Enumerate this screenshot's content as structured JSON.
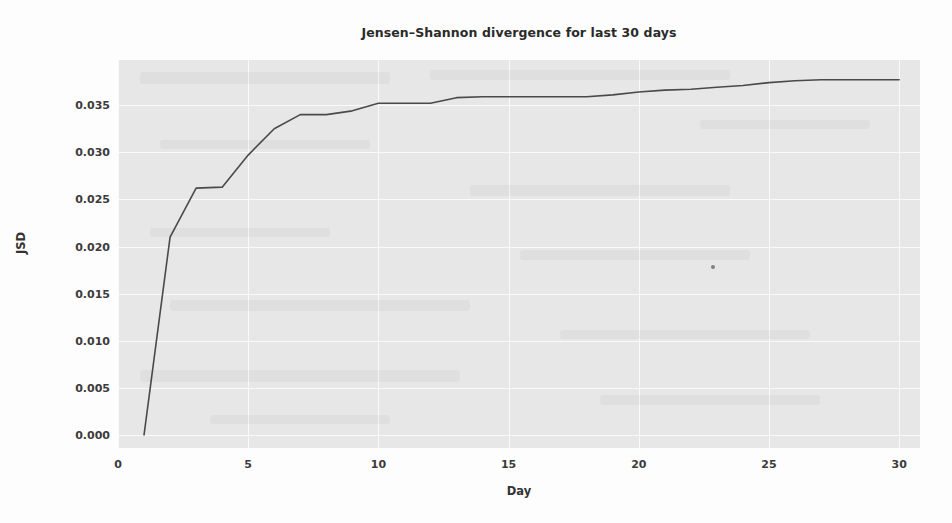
{
  "chart_data": {
    "type": "line",
    "title": "Jensen–Shannon divergence for last 30 days",
    "xlabel": "Day",
    "ylabel": "JSD",
    "xlim": [
      0,
      30.8
    ],
    "ylim": [
      -0.0014,
      0.0398
    ],
    "grid": true,
    "legend": null,
    "xticks": [
      0,
      5,
      10,
      15,
      20,
      25,
      30
    ],
    "xtick_labels": [
      "0",
      "5",
      "10",
      "15",
      "20",
      "25",
      "30"
    ],
    "yticks": [
      0.0,
      0.005,
      0.01,
      0.015,
      0.02,
      0.025,
      0.03,
      0.035
    ],
    "ytick_labels": [
      "0.000",
      "0.005",
      "0.010",
      "0.015",
      "0.020",
      "0.025",
      "0.030",
      "0.035"
    ],
    "series": [
      {
        "name": "JSD",
        "color": "#4a4a4a",
        "linewidth": 1.6,
        "x": [
          1,
          2,
          3,
          4,
          5,
          6,
          7,
          8,
          9,
          10,
          11,
          12,
          13,
          14,
          15,
          16,
          17,
          18,
          19,
          20,
          21,
          22,
          23,
          24,
          25,
          26,
          27,
          28,
          29,
          30
        ],
        "y": [
          0.0,
          0.021,
          0.0262,
          0.0263,
          0.0297,
          0.0325,
          0.034,
          0.034,
          0.0344,
          0.0352,
          0.0352,
          0.0352,
          0.0358,
          0.0359,
          0.0359,
          0.0359,
          0.0359,
          0.0359,
          0.0361,
          0.0364,
          0.0366,
          0.0367,
          0.0369,
          0.0371,
          0.0374,
          0.0376,
          0.0377,
          0.0377,
          0.0377,
          0.0377
        ]
      }
    ],
    "annotations": [
      {
        "name": "stray-dot",
        "x": 22.85,
        "y": 0.0178
      }
    ],
    "style": {
      "plot_background": "#e7e7e7",
      "figure_background": "#fdfdfd",
      "grid_color": "#fafafa",
      "text_color": "#333333",
      "line_color": "#4a4a4a"
    }
  }
}
